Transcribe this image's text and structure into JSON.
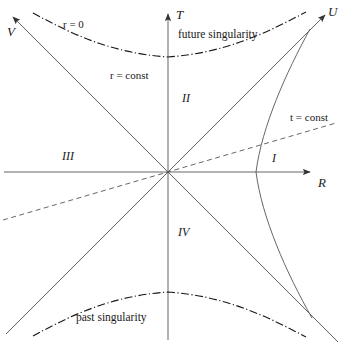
{
  "figure": {
    "kind": "kruskal-szekeres-diagram",
    "background_color": "#ffffff",
    "ink_color": "#1a1a1a",
    "line_color": "#555555",
    "width": 344,
    "height": 345
  },
  "axes": {
    "vertical_label": "T",
    "horizontal_label": "R",
    "lightcone_upper_left_label": "V",
    "lightcone_upper_right_label": "U",
    "origin": {
      "x": 168,
      "y": 172
    },
    "vertical_arrow_tip_y": 8,
    "horizontal_arrow_tip_x": 315
  },
  "regions": [
    {
      "id": "region-I",
      "label": "I",
      "x": 272,
      "y": 152
    },
    {
      "id": "region-II",
      "label": "II",
      "x": 182,
      "y": 92
    },
    {
      "id": "region-III",
      "label": "III",
      "x": 62,
      "y": 150
    },
    {
      "id": "region-IV",
      "label": "IV",
      "x": 178,
      "y": 226
    }
  ],
  "annotations": {
    "r_zero": "r = 0",
    "r_const": "r = const",
    "t_const": "t = const",
    "future_singularity": "future singularity",
    "past_singularity": "past singularity"
  },
  "curves": {
    "future_singularity": {
      "style": "dash-dot",
      "vertex": {
        "x": 168,
        "y": 57
      },
      "description": "upper spacelike hyperbola r = 0"
    },
    "past_singularity": {
      "style": "dash-dot",
      "vertex": {
        "x": 168,
        "y": 292
      },
      "description": "lower spacelike hyperbola r = 0"
    },
    "r_const_hyperbola": {
      "style": "solid",
      "vertex": {
        "x": 256,
        "y": 172
      },
      "description": "timelike hyperbola of constant r in region I"
    },
    "t_const_line": {
      "style": "dashed",
      "slope": 0.29,
      "description": "straight line of constant t through the bifurcation point"
    },
    "horizon_diagonals": {
      "style": "solid",
      "slope": 1,
      "description": "the two 45 degree event horizons crossing at the origin"
    }
  }
}
